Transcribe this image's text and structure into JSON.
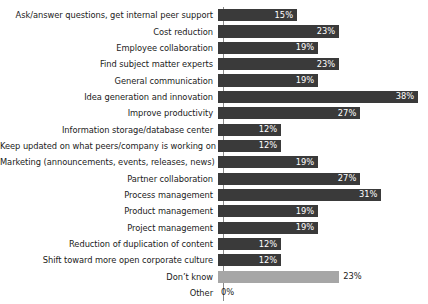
{
  "chart_data": {
    "type": "bar",
    "orientation": "horizontal",
    "title": "",
    "subtitle": "",
    "xlabel": "",
    "ylabel": "",
    "xlim": [
      0,
      38
    ],
    "grid": false,
    "legend": false,
    "value_suffix": "%",
    "categories": [
      "Ask/answer questions, get internal peer support",
      "Cost reduction",
      "Employee collaboration",
      "Find subject matter experts",
      "General communication",
      "Idea generation and innovation",
      "Improve productivity",
      "Information storage/database center",
      "Keep updated on what peers/company is working on",
      "Marketing (announcements, events, releases, news)",
      "Partner collaboration",
      "Process management",
      "Product management",
      "Project management",
      "Reduction of duplication of content",
      "Shift toward more open corporate culture",
      "Don’t know",
      "Other"
    ],
    "values": [
      15,
      23,
      19,
      23,
      19,
      38,
      27,
      12,
      12,
      19,
      27,
      31,
      19,
      19,
      12,
      12,
      23,
      0
    ],
    "value_labels": [
      "15%",
      "23%",
      "19%",
      "23%",
      "19%",
      "38%",
      "27%",
      "12%",
      "12%",
      "19%",
      "27%",
      "31%",
      "19%",
      "19%",
      "12%",
      "12%",
      "23%",
      "0%"
    ],
    "bar_colors": [
      "#3a3a3a",
      "#3a3a3a",
      "#3a3a3a",
      "#3a3a3a",
      "#3a3a3a",
      "#3a3a3a",
      "#3a3a3a",
      "#3a3a3a",
      "#3a3a3a",
      "#3a3a3a",
      "#3a3a3a",
      "#3a3a3a",
      "#3a3a3a",
      "#3a3a3a",
      "#3a3a3a",
      "#3a3a3a",
      "#a6a6a6",
      "#ffffff"
    ],
    "label_placement": [
      "inside",
      "inside",
      "inside",
      "inside",
      "inside",
      "inside",
      "inside",
      "inside",
      "inside",
      "inside",
      "inside",
      "inside",
      "inside",
      "inside",
      "inside",
      "inside",
      "outside",
      "outside"
    ],
    "axis_color": "#8a8a8a",
    "background_color": "#ffffff",
    "text_color": "#1b1b1b"
  }
}
